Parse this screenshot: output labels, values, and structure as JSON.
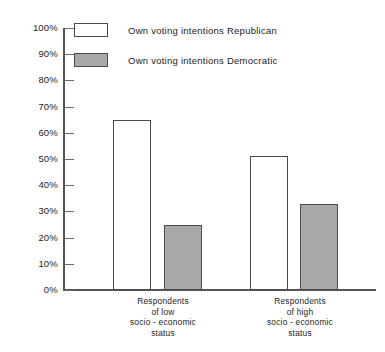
{
  "chart_data": {
    "type": "bar",
    "title": "",
    "xlabel": "",
    "ylabel": "",
    "ylim": [
      0,
      100
    ],
    "grid": false,
    "legend_position": "top-left",
    "categories": [
      "Respondents of low socio - economic status",
      "Respondents of high socio - economic status"
    ],
    "series": [
      {
        "name": "Own voting intentions Republican",
        "values": [
          65,
          51
        ]
      },
      {
        "name": "Own voting intentions Democratic",
        "values": [
          25,
          33
        ]
      }
    ],
    "y_ticks": [
      {
        "value": 100,
        "label": "100%"
      },
      {
        "value": 90,
        "label": "90%"
      },
      {
        "value": 80,
        "label": "80%"
      },
      {
        "value": 70,
        "label": "70%"
      },
      {
        "value": 60,
        "label": "60%"
      },
      {
        "value": 50,
        "label": "50%"
      },
      {
        "value": 40,
        "label": "40%"
      },
      {
        "value": 30,
        "label": "30%"
      },
      {
        "value": 20,
        "label": "20%"
      },
      {
        "value": 10,
        "label": "10%"
      },
      {
        "value": 0,
        "label": "0%"
      }
    ]
  },
  "legend": {
    "items": [
      {
        "label": "Own voting intentions Republican",
        "swatch": "republican",
        "color": "#ffffff"
      },
      {
        "label": "Own voting intentions Democratic",
        "swatch": "democratic",
        "color": "#a8a8a8"
      }
    ]
  },
  "groups": [
    {
      "lines": [
        "Respondents",
        "of low",
        "socio - economic",
        "status"
      ]
    },
    {
      "lines": [
        "Respondents",
        "of high",
        "socio - economic",
        "status"
      ]
    }
  ],
  "colors": {
    "republican_fill": "#ffffff",
    "democratic_fill": "#a8a8a8",
    "bar_outline": "#4a4a4a",
    "axis": "#555555",
    "text": "#1d1d1d",
    "background": "#ffffff"
  }
}
